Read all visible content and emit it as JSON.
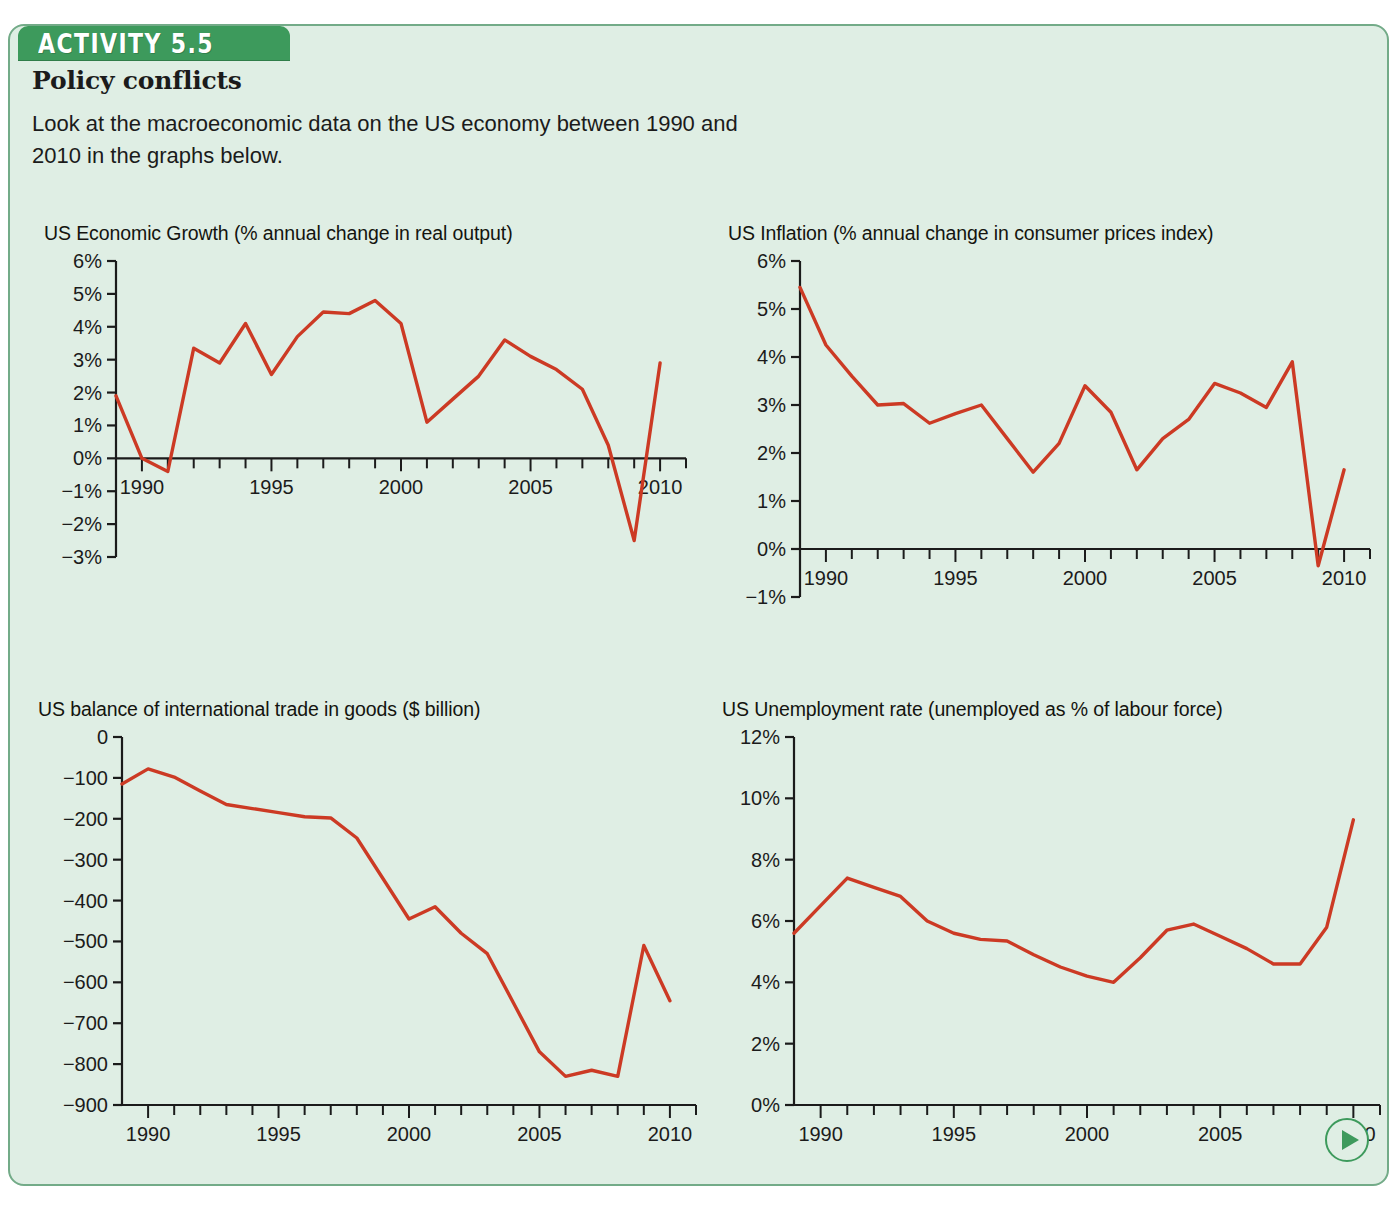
{
  "activity": {
    "tab_label": "ACTIVITY 5.5",
    "heading": "Policy conflicts",
    "intro": "Look at the macroeconomic data on the US economy between 1990 and 2010 in the graphs below."
  },
  "colors": {
    "panel_background": "#dfeee4",
    "panel_border": "#73ab88",
    "tab_green": "#3d9a5c",
    "line_red": "#cc3a24",
    "axis_black": "#1b1b1b"
  },
  "next_button": {
    "icon": "play-triangle-icon",
    "label": "Next"
  },
  "chart_data": [
    {
      "id": "growth",
      "type": "line",
      "title": "US Economic Growth (% annual change in real output)",
      "xlabel": "",
      "ylabel": "",
      "xlim": [
        1989,
        2011
      ],
      "ylim": [
        -3,
        6
      ],
      "ytick_labels": [
        "6%",
        "5%",
        "4%",
        "3%",
        "2%",
        "1%",
        "0%",
        "−1%",
        "−2%",
        "−3%"
      ],
      "ytick_values": [
        6,
        5,
        4,
        3,
        2,
        1,
        0,
        -1,
        -2,
        -3
      ],
      "xtick_labels": [
        "1990",
        "1995",
        "2000",
        "2005",
        "2010"
      ],
      "xtick_values": [
        1990,
        1995,
        2000,
        2005,
        2010
      ],
      "axis_baseline": 0,
      "grid": false,
      "legend": "none",
      "x": [
        1989,
        1990,
        1991,
        1992,
        1993,
        1994,
        1995,
        1996,
        1997,
        1998,
        1999,
        2000,
        2001,
        2002,
        2003,
        2004,
        2005,
        2006,
        2007,
        2008,
        2009,
        2010
      ],
      "values": [
        1.9,
        0.0,
        -0.4,
        3.35,
        2.9,
        4.1,
        2.55,
        3.7,
        4.45,
        4.4,
        4.8,
        4.1,
        1.1,
        1.8,
        2.5,
        3.6,
        3.1,
        2.7,
        2.1,
        0.4,
        -2.5,
        2.9
      ]
    },
    {
      "id": "inflation",
      "type": "line",
      "title": "US Inflation (% annual change in consumer prices index)",
      "xlabel": "",
      "ylabel": "",
      "xlim": [
        1989,
        2011
      ],
      "ylim": [
        -1,
        6
      ],
      "ytick_labels": [
        "6%",
        "5%",
        "4%",
        "3%",
        "2%",
        "1%",
        "0%",
        "−1%"
      ],
      "ytick_values": [
        6,
        5,
        4,
        3,
        2,
        1,
        0,
        -1
      ],
      "xtick_labels": [
        "1990",
        "1995",
        "2000",
        "2005",
        "2010"
      ],
      "xtick_values": [
        1990,
        1995,
        2000,
        2005,
        2010
      ],
      "axis_baseline": 0,
      "grid": false,
      "legend": "none",
      "x": [
        1989,
        1990,
        1991,
        1992,
        1993,
        1994,
        1995,
        1996,
        1997,
        1998,
        1999,
        2000,
        2001,
        2002,
        2003,
        2004,
        2005,
        2006,
        2007,
        2008,
        2009,
        2010
      ],
      "values": [
        5.45,
        4.25,
        3.6,
        3.0,
        3.03,
        2.62,
        2.82,
        3.0,
        2.3,
        1.6,
        2.2,
        3.4,
        2.85,
        1.65,
        2.3,
        2.7,
        3.45,
        3.25,
        2.95,
        3.9,
        -0.35,
        1.65
      ]
    },
    {
      "id": "trade",
      "type": "line",
      "title": "US balance of international trade in goods ($ billion)",
      "xlabel": "",
      "ylabel": "",
      "xlim": [
        1989,
        2011
      ],
      "ylim": [
        -900,
        0
      ],
      "ytick_labels": [
        "0",
        "−100",
        "−200",
        "−300",
        "−400",
        "−500",
        "−600",
        "−700",
        "−800",
        "−900"
      ],
      "ytick_values": [
        0,
        -100,
        -200,
        -300,
        -400,
        -500,
        -600,
        -700,
        -800,
        -900
      ],
      "xtick_labels": [
        "1990",
        "1995",
        "2000",
        "2005",
        "2010"
      ],
      "xtick_values": [
        1990,
        1995,
        2000,
        2005,
        2010
      ],
      "axis_baseline": -900,
      "grid": false,
      "legend": "none",
      "x": [
        1989,
        1990,
        1991,
        1992,
        1993,
        1994,
        1995,
        1996,
        1997,
        1998,
        1999,
        2000,
        2001,
        2002,
        2003,
        2004,
        2005,
        2006,
        2007,
        2008,
        2009,
        2010
      ],
      "values": [
        -115,
        -78,
        -98,
        -132,
        -165,
        -175,
        -185,
        -195,
        -198,
        -247,
        -346,
        -445,
        -415,
        -480,
        -530,
        -650,
        -770,
        -830,
        -815,
        -830,
        -510,
        -645
      ]
    },
    {
      "id": "unemployment",
      "type": "line",
      "title": "US Unemployment rate (unemployed as % of labour force)",
      "xlabel": "",
      "ylabel": "",
      "xlim": [
        1989,
        2011
      ],
      "ylim": [
        0,
        12
      ],
      "ytick_labels": [
        "12%",
        "10%",
        "8%",
        "6%",
        "4%",
        "2%",
        "0%"
      ],
      "ytick_values": [
        12,
        10,
        8,
        6,
        4,
        2,
        0
      ],
      "xtick_labels": [
        "1990",
        "1995",
        "2000",
        "2005",
        "2010"
      ],
      "xtick_values": [
        1990,
        1995,
        2000,
        2005,
        2010
      ],
      "axis_baseline": 0,
      "grid": false,
      "legend": "none",
      "x": [
        1989,
        1990,
        1991,
        1992,
        1993,
        1994,
        1995,
        1996,
        1997,
        1998,
        1999,
        2000,
        2001,
        2002,
        2003,
        2004,
        2005,
        2006,
        2007,
        2008,
        2009,
        2010
      ],
      "values": [
        5.6,
        6.5,
        7.4,
        7.1,
        6.8,
        6.0,
        5.6,
        5.4,
        5.35,
        4.9,
        4.5,
        4.2,
        4.0,
        4.8,
        5.7,
        5.9,
        5.5,
        5.1,
        4.6,
        4.6,
        5.8,
        9.3
      ]
    }
  ]
}
